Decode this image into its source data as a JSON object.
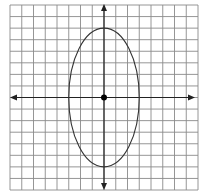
{
  "chart_data": {
    "type": "scatter",
    "title": "",
    "xlabel": "",
    "ylabel": "",
    "grid": true,
    "grid_cells": {
      "columns": 16,
      "rows": 16
    },
    "xlim": [
      -8,
      8
    ],
    "ylim": [
      -8,
      8
    ],
    "axes": {
      "x_arrows": true,
      "y_arrows": true
    },
    "series": [
      {
        "name": "ellipse",
        "shape": "ellipse",
        "center": [
          0,
          0
        ],
        "semi_axis_x": 3,
        "semi_axis_y": 6
      },
      {
        "name": "center-point",
        "shape": "point",
        "x": [
          0
        ],
        "y": [
          0
        ]
      }
    ],
    "colors": {
      "grid": "#8a8a8a",
      "axis": "#222222",
      "curve": "#333333",
      "point": "#000000"
    }
  }
}
